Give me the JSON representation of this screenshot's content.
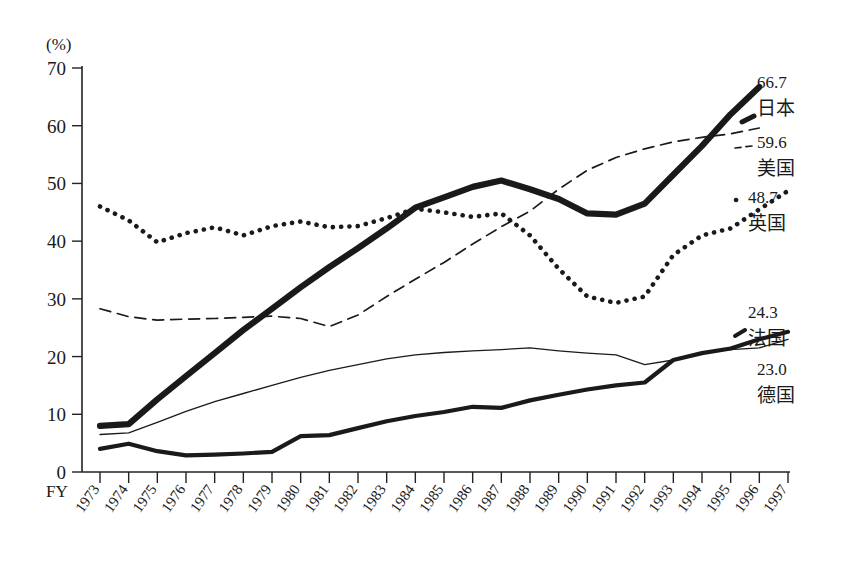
{
  "chart_data": {
    "type": "line",
    "title": "",
    "xlabel": "FY",
    "ylabel": "(%)",
    "ylim": [
      0,
      70
    ],
    "ytick_step": 10,
    "yticks": [
      "0",
      "10",
      "20",
      "30",
      "40",
      "50",
      "60",
      "70"
    ],
    "grid": false,
    "legend_position": "right-end-labels",
    "categories": [
      "1973",
      "1974",
      "1975",
      "1976",
      "1977",
      "1978",
      "1979",
      "1980",
      "1981",
      "1982",
      "1983",
      "1984",
      "1985",
      "1986",
      "1987",
      "1988",
      "1989",
      "1990",
      "1991",
      "1992",
      "1993",
      "1994",
      "1995",
      "1996",
      "1997"
    ],
    "series": [
      {
        "name": "日本",
        "style": "thick-double",
        "end_value": "66.7",
        "end_label": "日本",
        "values": [
          8.0,
          8.3,
          12.6,
          16.6,
          20.6,
          24.6,
          28.3,
          32.0,
          35.5,
          38.8,
          42.2,
          45.8,
          47.6,
          49.4,
          50.5,
          49.0,
          47.3,
          44.8,
          44.6,
          46.5,
          51.5,
          56.5,
          62.0,
          66.7,
          null
        ]
      },
      {
        "name": "美国",
        "style": "dashed",
        "end_value": "59.6",
        "end_label": "美国",
        "values": [
          28.3,
          26.9,
          26.3,
          26.5,
          26.6,
          26.8,
          27.0,
          26.6,
          25.2,
          27.2,
          30.4,
          33.4,
          36.3,
          39.5,
          42.5,
          45.2,
          49.0,
          52.3,
          54.5,
          56.0,
          57.2,
          58.0,
          58.6,
          59.6,
          null
        ]
      },
      {
        "name": "英国",
        "style": "dotted",
        "end_value": "48.7",
        "end_label": "英国",
        "values": [
          46.0,
          43.6,
          39.8,
          41.4,
          42.4,
          41.0,
          42.6,
          43.4,
          42.4,
          42.6,
          44.0,
          45.6,
          45.0,
          44.2,
          44.8,
          41.0,
          35.2,
          30.4,
          29.3,
          30.4,
          37.6,
          41.0,
          42.2,
          45.5,
          48.7
        ]
      },
      {
        "name": "法国",
        "style": "thick-solid",
        "end_value": "24.3",
        "end_label": "法国",
        "values": [
          4.0,
          4.9,
          3.6,
          2.9,
          3.0,
          3.2,
          3.5,
          6.2,
          6.4,
          7.6,
          8.8,
          9.7,
          10.4,
          11.3,
          11.1,
          12.4,
          13.4,
          14.3,
          15.0,
          15.5,
          19.4,
          20.6,
          21.4,
          23.0,
          24.3
        ]
      },
      {
        "name": "德国",
        "style": "thin-solid",
        "end_value": "23.0",
        "end_label": "德国",
        "values": [
          6.5,
          6.8,
          8.6,
          10.5,
          12.2,
          13.6,
          15.0,
          16.4,
          17.6,
          18.6,
          19.6,
          20.3,
          20.7,
          21.0,
          21.2,
          21.5,
          21.0,
          20.6,
          20.3,
          18.6,
          19.4,
          20.7,
          21.2,
          21.5,
          23.0
        ]
      }
    ],
    "end_labels": [
      {
        "value": "66.7",
        "name": "日本"
      },
      {
        "value": "59.6",
        "name": "美国"
      },
      {
        "value": "48.7",
        "name": "英国"
      },
      {
        "value": "24.3",
        "name": "法国"
      },
      {
        "value": "23.0",
        "name": "德国"
      }
    ],
    "colors": {
      "ink": "#1a1a1a",
      "background": "#ffffff"
    }
  }
}
